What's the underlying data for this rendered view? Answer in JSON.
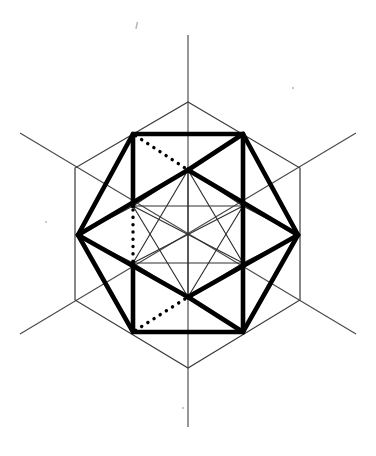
{
  "figure": {
    "width": 376,
    "height": 456,
    "background_color": "#ffffff",
    "stroke_colors": {
      "bold": "#000000",
      "thin": "#2e2e2e",
      "axis": "#4a4a4a",
      "dotted": "#000000"
    }
  },
  "geometry": {
    "center": {
      "x": 188,
      "y": 233
    },
    "axes": [
      {
        "name": "vertical-axis",
        "x1": 188,
        "y1": 35,
        "x2": 188,
        "y2": 427
      },
      {
        "name": "diagonal-axis-nw-se",
        "x1": 20,
        "y1": 133,
        "x2": 356,
        "y2": 334
      },
      {
        "name": "diagonal-axis-ne-sw",
        "x1": 356,
        "y1": 133,
        "x2": 20,
        "y2": 334
      }
    ],
    "construction_hexagon": {
      "name": "thin-outer-hexagon",
      "points": "188,102 300,168 300,300 188,368 75,300 75,168"
    },
    "bold_outer_polygon": {
      "name": "bold-hexagonal-outline",
      "points": "133,134 243,134 298,235 243,332 133,332 78,235"
    },
    "inner_vertices": [
      {
        "name": "inner-top",
        "x": 188,
        "y": 170
      },
      {
        "name": "inner-upper-right",
        "x": 243,
        "y": 206
      },
      {
        "name": "inner-lower-right",
        "x": 243,
        "y": 263
      },
      {
        "name": "inner-bottom",
        "x": 188,
        "y": 297
      },
      {
        "name": "inner-lower-left",
        "x": 133,
        "y": 263
      },
      {
        "name": "inner-upper-left",
        "x": 133,
        "y": 206
      }
    ],
    "bold_edges": [
      {
        "name": "bold-edge-left-to-inner-top",
        "x1": 78,
        "y1": 235,
        "x2": 188,
        "y2": 170
      },
      {
        "name": "bold-edge-inner-top-to-topright",
        "x1": 188,
        "y1": 170,
        "x2": 243,
        "y2": 134
      },
      {
        "name": "bold-edge-left-to-inner-bottom",
        "x1": 78,
        "y1": 235,
        "x2": 188,
        "y2": 297
      },
      {
        "name": "bold-edge-inner-bottom-to-bottomright",
        "x1": 188,
        "y1": 297,
        "x2": 243,
        "y2": 332
      },
      {
        "name": "bold-edge-vertical-right",
        "x1": 243,
        "y1": 134,
        "x2": 243,
        "y2": 332
      },
      {
        "name": "bold-edge-inner-top-to-right",
        "x1": 188,
        "y1": 170,
        "x2": 298,
        "y2": 235
      },
      {
        "name": "bold-edge-inner-bottom-to-right",
        "x1": 188,
        "y1": 297,
        "x2": 298,
        "y2": 235
      },
      {
        "name": "bold-edge-upperleft-to-innerleft",
        "x1": 133,
        "y1": 134,
        "x2": 133,
        "y2": 206
      },
      {
        "name": "bold-edge-innerleft-lower",
        "x1": 133,
        "y1": 263,
        "x2": 133,
        "y2": 332
      }
    ],
    "thin_edges": [
      {
        "name": "thin-edge-innerleft-to-innerright-upper",
        "x1": 133,
        "y1": 206,
        "x2": 243,
        "y2": 206
      },
      {
        "name": "thin-edge-innerleft-to-innerright-lower",
        "x1": 133,
        "y1": 263,
        "x2": 243,
        "y2": 263
      },
      {
        "name": "thin-edge-innerupperleft-to-innerbottom",
        "x1": 133,
        "y1": 206,
        "x2": 188,
        "y2": 297
      },
      {
        "name": "thin-edge-innerupperright-to-innerbottom",
        "x1": 243,
        "y1": 206,
        "x2": 188,
        "y2": 297
      },
      {
        "name": "thin-edge-innerlowerleft-to-innertop",
        "x1": 133,
        "y1": 263,
        "x2": 188,
        "y2": 170
      },
      {
        "name": "thin-edge-innerlowerright-to-innertop",
        "x1": 243,
        "y1": 263,
        "x2": 188,
        "y2": 170
      },
      {
        "name": "thin-edge-innerupperleft-to-innerlowerright",
        "x1": 133,
        "y1": 206,
        "x2": 243,
        "y2": 263
      },
      {
        "name": "thin-edge-innerlowerleft-to-innerupperright",
        "x1": 133,
        "y1": 263,
        "x2": 243,
        "y2": 206
      },
      {
        "name": "thin-edge-innertop-to-innerbottom",
        "x1": 188,
        "y1": 170,
        "x2": 188,
        "y2": 297
      },
      {
        "name": "thin-edge-innertop-to-innerupperleft",
        "x1": 188,
        "y1": 170,
        "x2": 133,
        "y2": 206
      },
      {
        "name": "thin-edge-innertop-to-innerupperright",
        "x1": 188,
        "y1": 170,
        "x2": 243,
        "y2": 206
      },
      {
        "name": "thin-edge-innerbottom-to-innerlowerleft",
        "x1": 188,
        "y1": 297,
        "x2": 133,
        "y2": 263
      },
      {
        "name": "thin-edge-innerbottom-to-innerlowerright",
        "x1": 188,
        "y1": 297,
        "x2": 243,
        "y2": 263
      },
      {
        "name": "thin-edge-innerlowerright-to-right",
        "x1": 243,
        "y1": 263,
        "x2": 298,
        "y2": 235
      },
      {
        "name": "thin-edge-innerupperright-to-right",
        "x1": 243,
        "y1": 206,
        "x2": 298,
        "y2": 235
      },
      {
        "name": "thin-edge-innerupperleft-to-left",
        "x1": 133,
        "y1": 206,
        "x2": 78,
        "y2": 235
      },
      {
        "name": "thin-edge-innerlowerleft-to-left",
        "x1": 133,
        "y1": 263,
        "x2": 78,
        "y2": 235
      }
    ],
    "hidden_edges": [
      {
        "name": "hidden-vertical-left",
        "x1": 133,
        "y1": 134,
        "x2": 133,
        "y2": 332
      },
      {
        "name": "hidden-diagonal-upperleft-to-innertop",
        "x1": 133,
        "y1": 134,
        "x2": 188,
        "y2": 170
      },
      {
        "name": "hidden-diagonal-innertop-to-right",
        "x1": 188,
        "y1": 170,
        "x2": 298,
        "y2": 235
      },
      {
        "name": "hidden-diagonal-lowerleft-to-innerbottom",
        "x1": 133,
        "y1": 332,
        "x2": 188,
        "y2": 297
      },
      {
        "name": "hidden-diagonal-innerbottom-to-right",
        "x1": 188,
        "y1": 297,
        "x2": 298,
        "y2": 235
      }
    ]
  }
}
